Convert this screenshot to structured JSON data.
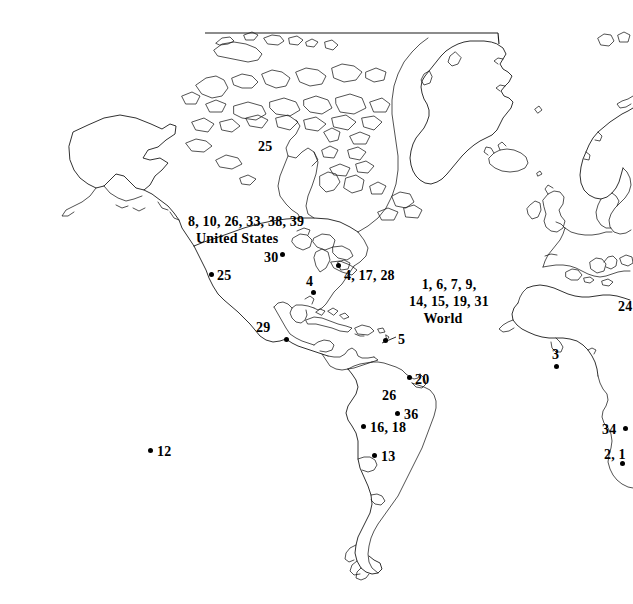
{
  "figure": {
    "background_color": "#ffffff",
    "line_color": "#1a1a1a",
    "marker_color": "#000000",
    "width": 633,
    "height": 604
  },
  "region_labels": {
    "united_states": "United States",
    "world": "World"
  },
  "labels": [
    {
      "id": "l-na-list",
      "text": "8, 10, 26, 33, 38, 39",
      "x": 188,
      "y": 215,
      "align": "left",
      "dot": false
    },
    {
      "id": "l-usa",
      "text": "United States",
      "x": 196,
      "y": 232,
      "align": "left",
      "dot": false
    },
    {
      "id": "l-25-canada",
      "text": "25",
      "x": 258,
      "y": 140,
      "align": "left",
      "dot": false
    },
    {
      "id": "l-30",
      "text": "30",
      "x": 264,
      "y": 251,
      "align": "left",
      "dot": true,
      "dot_x": 282,
      "dot_y": 254
    },
    {
      "id": "l-25-west",
      "text": "25",
      "x": 217,
      "y": 269,
      "align": "left",
      "dot": true,
      "dot_x": 211,
      "dot_y": 274
    },
    {
      "id": "l-4-east",
      "text": "4",
      "x": 306,
      "y": 275,
      "align": "left",
      "dot": true,
      "dot_x": 313,
      "dot_y": 292
    },
    {
      "id": "l-4-17-28",
      "text": "4, 17, 28",
      "x": 344,
      "y": 269,
      "align": "left",
      "dot": true,
      "dot_x": 338,
      "dot_y": 265
    },
    {
      "id": "l-world-1",
      "text": "1, 6, 7, 9,",
      "x": 449,
      "y": 278,
      "align": "center",
      "dot": false
    },
    {
      "id": "l-world-2",
      "text": "14, 15, 19, 31",
      "x": 449,
      "y": 295,
      "align": "center",
      "dot": false
    },
    {
      "id": "l-world-3",
      "text": "World",
      "x": 443,
      "y": 312,
      "align": "center",
      "dot": false
    },
    {
      "id": "l-29",
      "text": "29",
      "x": 256,
      "y": 321,
      "align": "left",
      "dot": true,
      "dot_x": 286,
      "dot_y": 339
    },
    {
      "id": "l-5",
      "text": "5",
      "x": 398,
      "y": 333,
      "align": "left",
      "dot": true,
      "dot_x": 385,
      "dot_y": 340
    },
    {
      "id": "l-3",
      "text": "3",
      "x": 552,
      "y": 348,
      "align": "left",
      "dot": true,
      "dot_x": 556,
      "dot_y": 366
    },
    {
      "id": "l-20",
      "text": "20",
      "x": 415,
      "y": 373,
      "align": "left",
      "dot": true,
      "dot_x": 409,
      "dot_y": 377
    },
    {
      "id": "l-26",
      "text": "26",
      "x": 382,
      "y": 389,
      "align": "left",
      "dot": false
    },
    {
      "id": "l-36",
      "text": "36",
      "x": 404,
      "y": 408,
      "align": "left",
      "dot": true,
      "dot_x": 397,
      "dot_y": 413
    },
    {
      "id": "l-16-18",
      "text": "16, 18",
      "x": 370,
      "y": 421,
      "align": "left",
      "dot": true,
      "dot_x": 363,
      "dot_y": 426
    },
    {
      "id": "l-24",
      "text": "24",
      "x": 618,
      "y": 300,
      "align": "left",
      "dot": false
    },
    {
      "id": "l-34",
      "text": "34",
      "x": 602,
      "y": 423,
      "align": "left",
      "dot": true,
      "dot_x": 625,
      "dot_y": 428
    },
    {
      "id": "l-2-1",
      "text": "2, 1",
      "x": 604,
      "y": 448,
      "align": "left",
      "dot": true,
      "dot_x": 622,
      "dot_y": 463
    },
    {
      "id": "l-12",
      "text": "12",
      "x": 157,
      "y": 445,
      "align": "left",
      "dot": true,
      "dot_x": 150,
      "dot_y": 450
    },
    {
      "id": "l-13",
      "text": "13",
      "x": 381,
      "y": 450,
      "align": "left",
      "dot": true,
      "dot_x": 374,
      "dot_y": 455
    }
  ]
}
